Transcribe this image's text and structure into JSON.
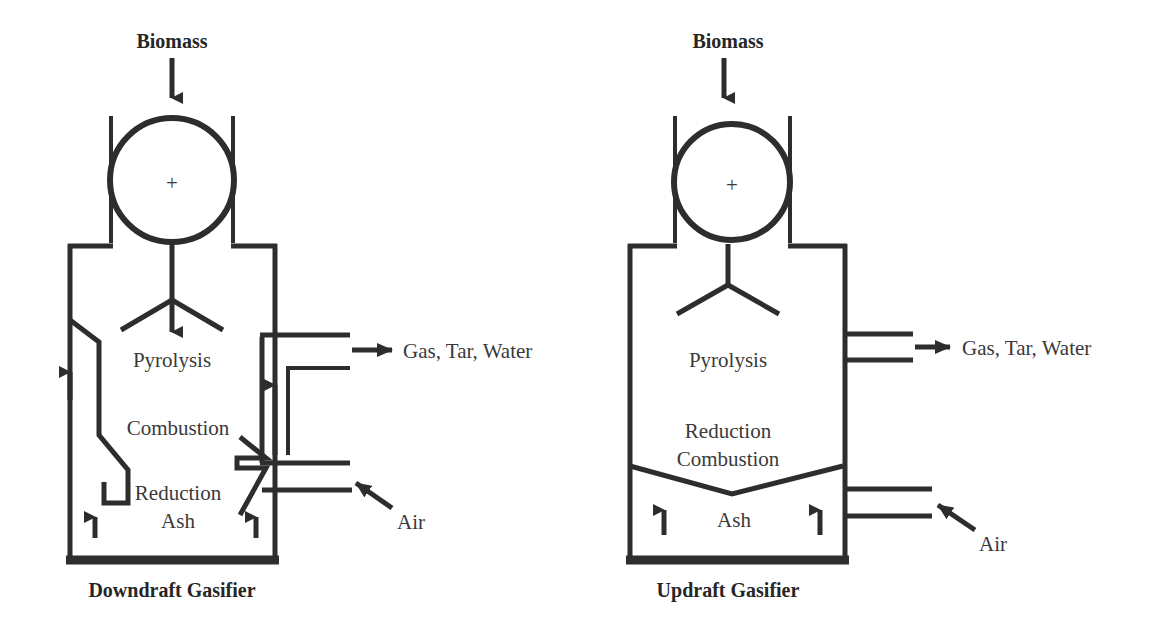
{
  "figure": {
    "ink_color": "#2d2d2d",
    "text_color": "#3a3a3a",
    "background": "#ffffff"
  },
  "downdraft": {
    "caption": "Downdraft Gasifier",
    "feed_label": "Biomass",
    "zones": {
      "pyrolysis": "Pyrolysis",
      "combustion": "Combustion",
      "reduction": "Reduction",
      "ash": "Ash"
    },
    "outlet_label": "Gas, Tar, Water",
    "inlet_label": "Air",
    "hopper_mark": "+"
  },
  "updraft": {
    "caption": "Updraft Gasifier",
    "feed_label": "Biomass",
    "zones": {
      "pyrolysis": "Pyrolysis",
      "reduction": "Reduction",
      "combustion": "Combustion",
      "ash": "Ash"
    },
    "outlet_label": "Gas, Tar, Water",
    "inlet_label": "Air",
    "hopper_mark": "+"
  }
}
